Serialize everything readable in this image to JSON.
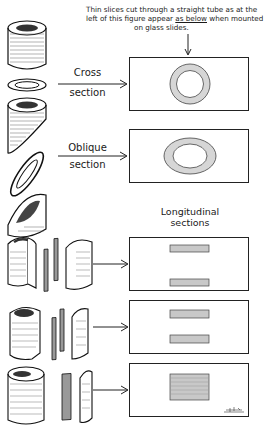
{
  "caption": {
    "line1": "Thin slices cut through a straight tube as at the",
    "line2_a": "left of this figure appear ",
    "line2_u": "as below",
    "line2_b": " when mounted",
    "line3": "on glass slides."
  },
  "labels": {
    "cross": [
      "Cross",
      "section"
    ],
    "oblique": [
      "Oblique",
      "section"
    ],
    "longitudinal": [
      "Longitudinal",
      "sections"
    ]
  },
  "slides": [
    {
      "id": "cross-section-slide",
      "content": "ring",
      "top": 57
    },
    {
      "id": "oblique-section-slide",
      "content": "oval ring",
      "top": 129
    },
    {
      "id": "longitudinal-slide-1",
      "content": "two strips far apart",
      "top": 237
    },
    {
      "id": "longitudinal-slide-2",
      "content": "two strips close together",
      "top": 300
    },
    {
      "id": "longitudinal-slide-3",
      "content": "single wide block",
      "top": 363
    }
  ],
  "colors": {
    "ink": "#1a1a1a",
    "tissue": "#cfcfcf",
    "paper": "#ffffff"
  },
  "signature": "artist monogram"
}
